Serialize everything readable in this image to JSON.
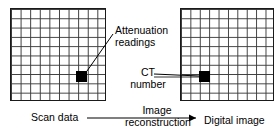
{
  "diagram": {
    "background_color": "#ffffff",
    "line_color": "#000000",
    "cell_color": "#000000",
    "grid_line_color": "#3a3a3a"
  },
  "grids": [
    {
      "name": "scan-data",
      "caption": "Scan data",
      "rows": 10,
      "columns": 10,
      "highlighted_cell": {
        "row": 7,
        "column": 7,
        "color": "#000000"
      },
      "annotation": "Attenuation readings"
    },
    {
      "name": "digital-image",
      "caption": "Digital image",
      "rows": 10,
      "columns": 10,
      "highlighted_cell": {
        "row": 7,
        "column": 2,
        "color": "#000000"
      },
      "annotation": "CT number"
    }
  ],
  "labels": {
    "attenuation_readings_line1": "Attenuation",
    "attenuation_readings_line2": "readings",
    "ct_number_line1": "CT",
    "ct_number_line2": "number",
    "scan_data": "Scan data",
    "image_reconstruction_line1": "Image",
    "image_reconstruction_line2": "reconstruction",
    "digital_image": "Digital image"
  },
  "arrow": {
    "name": "process-arrow",
    "label": "Image reconstruction",
    "direction": "left-to-right",
    "from": "Scan data",
    "to": "Digital image"
  }
}
